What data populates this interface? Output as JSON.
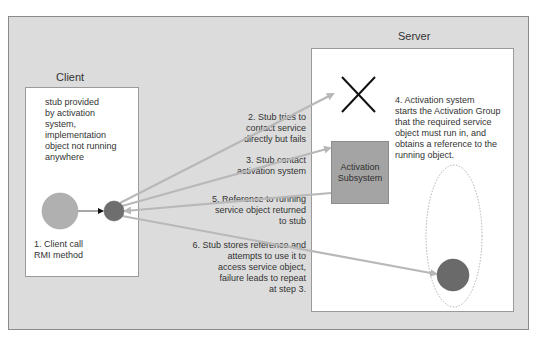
{
  "diagram": {
    "client": {
      "title": "Client",
      "note": [
        "stub provided",
        "by activation",
        "system,",
        "implementation",
        "object not running",
        "anywhere"
      ],
      "client_object_label": [
        "1. Client call",
        "RMI method"
      ]
    },
    "server": {
      "title": "Server",
      "activation_subsystem_label": [
        "Activation",
        "Subsystem"
      ],
      "step4": [
        "4. Activation system",
        "starts the Activation Group",
        "that the required service",
        "object must run in, and",
        "obtains a reference to the",
        "running object."
      ]
    },
    "steps": {
      "step2": [
        "2. Stub tries to",
        "contact service",
        "directly but fails"
      ],
      "step3": [
        "3. Stub contact",
        "activation system"
      ],
      "step5": [
        "5. Reference to running",
        "service object returned",
        "to stub"
      ],
      "step6": [
        "6. Stub stores reference and",
        "attempts to use it to",
        "access service object,",
        "failure leads to repeat",
        "at step 3."
      ]
    },
    "colors": {
      "background": "#dcdcdc",
      "box": "#ffffff",
      "client_object": "#b0b0b0",
      "stub": "#6e6e6e",
      "activation_subsystem": "#a4a4a4",
      "service_object": "#6a6a6a",
      "arrow": "#b8b8b8"
    }
  }
}
